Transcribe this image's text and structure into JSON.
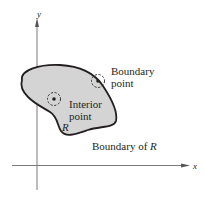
{
  "diagram": {
    "axes": {
      "x_label": "x",
      "y_label": "y"
    },
    "region": {
      "name": "R",
      "fill_color": "#d4d4d4",
      "stroke_color": "#231f20"
    },
    "labels": {
      "boundary_point_line1": "Boundary",
      "boundary_point_line2": "point",
      "interior_point_line1": "Interior",
      "interior_point_line2": "point",
      "boundary_of_prefix": "Boundary of ",
      "boundary_of_var": "R"
    },
    "colors": {
      "ink": "#231f20",
      "axis": "#6d6d6d",
      "background": "#ffffff"
    }
  }
}
